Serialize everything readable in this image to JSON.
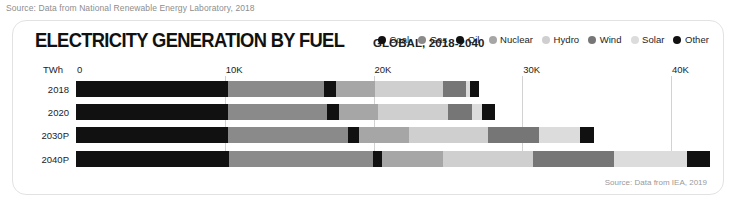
{
  "top_source": "Source: Data from National Renewable Energy Laboratory, 2018",
  "footer_source": "Source: Data from IEA, 2019",
  "header": {
    "title": "ELECTRICITY GENERATION BY FUEL",
    "subtitle": "GLOBAL, 2018-2040"
  },
  "legend": [
    {
      "label": "Coal",
      "color": "#111111"
    },
    {
      "label": "Gas",
      "color": "#8a8a8a"
    },
    {
      "label": "Oil",
      "color": "#111111"
    },
    {
      "label": "Nuclear",
      "color": "#a6a6a6"
    },
    {
      "label": "Hydro",
      "color": "#cfcfcf"
    },
    {
      "label": "Wind",
      "color": "#767676"
    },
    {
      "label": "Solar",
      "color": "#dcdcdc"
    },
    {
      "label": "Other",
      "color": "#111111"
    }
  ],
  "chart_data": {
    "type": "bar",
    "orientation": "horizontal",
    "stacked": true,
    "title": "ELECTRICITY GENERATION BY FUEL",
    "subtitle": "GLOBAL, 2018-2040",
    "xlabel": "TWh",
    "ylabel": "",
    "unit_label": "TWh",
    "xlim": [
      0,
      41000
    ],
    "xticks": [
      0,
      10000,
      20000,
      30000,
      40000
    ],
    "xtick_labels": [
      "0",
      "10K",
      "20K",
      "30K",
      "40K"
    ],
    "grid": true,
    "legend_position": "top-right",
    "categories": [
      "2018",
      "2020",
      "2030P",
      "2040P"
    ],
    "series": [
      {
        "name": "Coal",
        "color": "#111111",
        "values": [
          10200,
          10200,
          10200,
          10300
        ]
      },
      {
        "name": "Gas",
        "color": "#8a8a8a",
        "values": [
          6500,
          6700,
          8100,
          9700
        ]
      },
      {
        "name": "Oil",
        "color": "#111111",
        "values": [
          800,
          800,
          700,
          600
        ]
      },
      {
        "name": "Nuclear",
        "color": "#a6a6a6",
        "values": [
          2600,
          2600,
          3400,
          4100
        ]
      },
      {
        "name": "Hydro",
        "color": "#cfcfcf",
        "values": [
          4600,
          4700,
          5300,
          6000
        ]
      },
      {
        "name": "Wind",
        "color": "#767676",
        "values": [
          1500,
          1600,
          3400,
          5500
        ]
      },
      {
        "name": "Solar",
        "color": "#dcdcdc",
        "values": [
          270,
          700,
          2800,
          4900
        ]
      },
      {
        "name": "Other",
        "color": "#111111",
        "values": [
          600,
          900,
          950,
          1550
        ]
      }
    ],
    "totals": [
      27070,
      28200,
      34850,
      42650
    ]
  }
}
